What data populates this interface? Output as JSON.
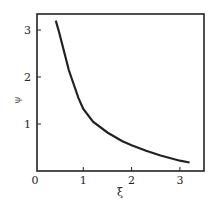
{
  "chart_data": {
    "type": "line",
    "title": "",
    "xlabel": "ξ",
    "ylabel": "ψ",
    "xlim": [
      0,
      3.5
    ],
    "ylim": [
      0,
      3.4
    ],
    "x_ticks": [
      "0",
      "1",
      "2",
      "3"
    ],
    "y_ticks": [
      "1",
      "2",
      "3"
    ],
    "grid": false,
    "series": [
      {
        "name": "ψ(ξ)",
        "x": [
          0.43,
          0.5,
          0.6,
          0.7,
          0.8,
          0.9,
          1.0,
          1.2,
          1.5,
          1.8,
          2.0,
          2.3,
          2.6,
          3.0,
          3.2
        ],
        "y": [
          3.2,
          2.95,
          2.55,
          2.15,
          1.85,
          1.55,
          1.32,
          1.05,
          0.82,
          0.64,
          0.55,
          0.43,
          0.33,
          0.22,
          0.18
        ]
      }
    ]
  }
}
